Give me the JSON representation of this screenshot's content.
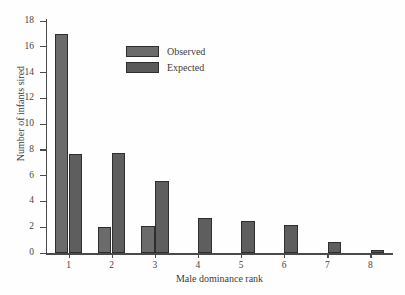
{
  "chart_data": {
    "type": "bar",
    "title": "",
    "xlabel": "Male dominance rank",
    "ylabel": "Number of infants sired",
    "categories": [
      "1",
      "2",
      "3",
      "4",
      "5",
      "6",
      "7",
      "8"
    ],
    "series": [
      {
        "name": "Observed",
        "values": [
          17.0,
          2.0,
          2.1,
          0,
          0,
          0,
          0,
          0
        ]
      },
      {
        "name": "Expected",
        "values": [
          7.7,
          7.75,
          5.6,
          2.7,
          2.45,
          2.2,
          0.85,
          0.2
        ]
      }
    ],
    "ylim": [
      0,
      18
    ],
    "yticks": [
      0,
      2,
      4,
      6,
      8,
      10,
      12,
      14,
      16,
      18
    ],
    "ytick_labels": [
      "0",
      "2",
      "4",
      "6",
      "8",
      "10",
      "12",
      "14",
      "16",
      "18"
    ],
    "xtick_labels": [
      "1",
      "2",
      "3",
      "4",
      "5",
      "6",
      "7",
      "8"
    ],
    "grid": false,
    "legend_position": "upper-center-left",
    "colors": {
      "observed": "#6b6b6b",
      "expected": "#5e5e5e",
      "axis": "#4a4a4a",
      "background": "#fefefe",
      "text": "#3c3c3c"
    }
  },
  "legend": {
    "entries": [
      {
        "label": "Observed",
        "key": "observed"
      },
      {
        "label": "Expected",
        "key": "expected"
      }
    ]
  }
}
